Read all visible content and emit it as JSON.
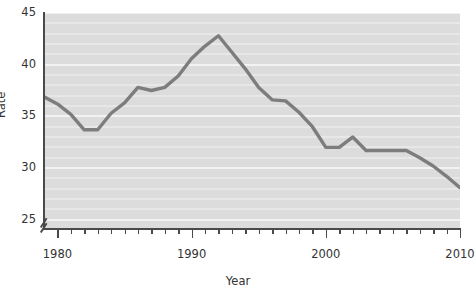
{
  "chart_data": {
    "type": "line",
    "title": "",
    "xlabel": "Year",
    "ylabel": "Rate",
    "xlim": [
      1979,
      2010
    ],
    "ylim": [
      24.2,
      45
    ],
    "grid": true,
    "grid_orientation": "horizontal",
    "legend": "none",
    "axis_break": "y-axis break below 25",
    "line_color": "#7d7d7d",
    "plot_background": "#dcdcdc",
    "gridline_color": "#f2f2f2",
    "x_tick_labels": [
      "1980",
      "1990",
      "2000",
      "2010"
    ],
    "x_tick_label_values": [
      1980,
      1990,
      2000,
      2010
    ],
    "x_minor_tick_interval": 1,
    "y_tick_labels": [
      "25",
      "30",
      "35",
      "40",
      "45"
    ],
    "y_tick_label_values": [
      25,
      30,
      35,
      40,
      45
    ],
    "x": [
      1979,
      1980,
      1981,
      1982,
      1983,
      1984,
      1985,
      1986,
      1987,
      1988,
      1989,
      1990,
      1991,
      1992,
      1993,
      1994,
      1995,
      1996,
      1997,
      1998,
      1999,
      2000,
      2001,
      2002,
      2003,
      2004,
      2005,
      2006,
      2007,
      2008,
      2009,
      2010
    ],
    "values": [
      36.9,
      36.2,
      35.2,
      33.7,
      33.7,
      35.3,
      36.3,
      37.8,
      37.5,
      37.8,
      38.9,
      40.6,
      41.8,
      42.8,
      41.2,
      39.6,
      37.8,
      36.6,
      36.5,
      35.4,
      34.0,
      32.0,
      32.0,
      33.0,
      31.7,
      31.7,
      31.7,
      31.7,
      31.0,
      30.2,
      29.2,
      28.1
    ]
  },
  "axis_titles": {
    "x": "Year",
    "y": "Rate"
  }
}
